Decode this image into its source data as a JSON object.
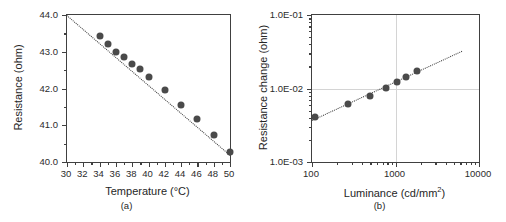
{
  "figure": {
    "panels": [
      {
        "id": "a",
        "caption": "(a)",
        "xlabel": "Temperature (°C)",
        "ylabel": "Resistance (ohm)"
      },
      {
        "id": "b",
        "caption": "(b)",
        "xlabel_prefix": "Luminance (cd/mm",
        "xlabel_sup": "2",
        "xlabel_suffix": ")",
        "ylabel": "Resistance change (ohm)"
      }
    ]
  },
  "chart_data": [
    {
      "type": "scatter",
      "panel": "a",
      "title": "",
      "xlabel": "Temperature (°C)",
      "ylabel": "Resistance (ohm)",
      "xscale": "linear",
      "yscale": "linear",
      "xlim": [
        30,
        50
      ],
      "ylim": [
        40.0,
        44.0
      ],
      "xticks": [
        30,
        32,
        34,
        36,
        38,
        40,
        42,
        44,
        46,
        48,
        50
      ],
      "xticklabels": [
        "30",
        "32",
        "34",
        "36",
        "38",
        "40",
        "42",
        "44",
        "46",
        "48",
        "50"
      ],
      "xminor_ticks": [
        31,
        33,
        35,
        37,
        39,
        41,
        43,
        45,
        47,
        49
      ],
      "yticks": [
        40.0,
        41.0,
        42.0,
        43.0,
        44.0
      ],
      "yticklabels": [
        "40.0",
        "41.0",
        "42.0",
        "43.0",
        "44.0"
      ],
      "yminor_ticks": [
        40.5,
        41.5,
        42.5,
        43.5
      ],
      "grid": false,
      "marker_color": "#4a4a4a",
      "marker_size_px": 7,
      "fit_style": "dotted",
      "fit_color": "#3a3a3a",
      "fit_endpoints": [
        [
          30.0,
          44.0
        ],
        [
          50.0,
          40.2
        ]
      ],
      "x": [
        34,
        35,
        36,
        37,
        38,
        39,
        40,
        42,
        44,
        46,
        48,
        50
      ],
      "y": [
        43.42,
        43.22,
        43.0,
        42.87,
        42.68,
        42.52,
        42.32,
        41.95,
        41.55,
        41.17,
        40.73,
        40.28
      ],
      "legend": null
    },
    {
      "type": "scatter",
      "panel": "b",
      "title": "",
      "xlabel": "Luminance (cd/mm2)",
      "ylabel": "Resistance change (ohm)",
      "xscale": "log",
      "yscale": "log",
      "xlim": [
        100,
        10000
      ],
      "ylim": [
        0.001,
        0.1
      ],
      "xticks": [
        100,
        1000,
        10000
      ],
      "xticklabels": [
        "100",
        "1000",
        "10000"
      ],
      "yticks": [
        0.001,
        0.01,
        0.1
      ],
      "yticklabels": [
        "1.0E-03",
        "1.0E-02",
        "1.0E-01"
      ],
      "grid": true,
      "gridlines_x": [
        1000
      ],
      "gridlines_y": [
        0.01
      ],
      "marker_color": "#4a4a4a",
      "marker_size_px": 7,
      "fit_style": "dotted",
      "fit_color": "#3a3a3a",
      "fit_endpoints": [
        [
          100,
          0.0037
        ],
        [
          6300,
          0.0325
        ]
      ],
      "x": [
        110,
        270,
        490,
        770,
        1050,
        1330,
        1800
      ],
      "y": [
        0.0041,
        0.0061,
        0.0078,
        0.0101,
        0.0124,
        0.0143,
        0.0175
      ],
      "legend": null
    }
  ]
}
